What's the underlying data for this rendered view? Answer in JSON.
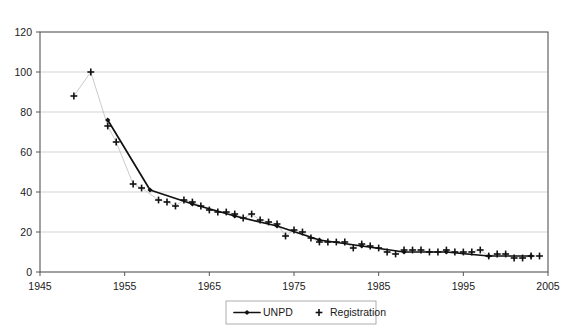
{
  "chart_data": {
    "type": "line",
    "title": "",
    "subtitle": "",
    "xlabel": "",
    "ylabel": "",
    "xlim": [
      1945,
      2005
    ],
    "ylim": [
      0,
      120
    ],
    "xticks": [
      1945,
      1955,
      1965,
      1975,
      1985,
      1995,
      2005
    ],
    "yticks": [
      0,
      20,
      40,
      60,
      80,
      100,
      120
    ],
    "grid": "horizontal",
    "legend_position": "bottom-center",
    "legend": [
      "UNPD",
      "Registration"
    ],
    "series": [
      {
        "name": "UNPD",
        "marker": "diamond",
        "line": true,
        "color": "#111111",
        "points": [
          {
            "x": 1953,
            "y": 76
          },
          {
            "x": 1958,
            "y": 41
          },
          {
            "x": 1963,
            "y": 34
          },
          {
            "x": 1968,
            "y": 28
          },
          {
            "x": 1973,
            "y": 23
          },
          {
            "x": 1978,
            "y": 16
          },
          {
            "x": 1983,
            "y": 13
          },
          {
            "x": 1988,
            "y": 10
          },
          {
            "x": 1993,
            "y": 10
          },
          {
            "x": 1998,
            "y": 8
          },
          {
            "x": 2003,
            "y": 8
          }
        ]
      },
      {
        "name": "Registration",
        "marker": "plus",
        "line": false,
        "color": "#111111",
        "points": [
          {
            "x": 1949,
            "y": 88
          },
          {
            "x": 1951,
            "y": 100
          },
          {
            "x": 1953,
            "y": 73
          },
          {
            "x": 1954,
            "y": 65
          },
          {
            "x": 1956,
            "y": 44
          },
          {
            "x": 1957,
            "y": 42
          },
          {
            "x": 1959,
            "y": 36
          },
          {
            "x": 1960,
            "y": 35
          },
          {
            "x": 1961,
            "y": 33
          },
          {
            "x": 1962,
            "y": 36
          },
          {
            "x": 1963,
            "y": 35
          },
          {
            "x": 1964,
            "y": 33
          },
          {
            "x": 1965,
            "y": 31
          },
          {
            "x": 1966,
            "y": 30
          },
          {
            "x": 1967,
            "y": 30
          },
          {
            "x": 1968,
            "y": 29
          },
          {
            "x": 1969,
            "y": 27
          },
          {
            "x": 1970,
            "y": 29
          },
          {
            "x": 1971,
            "y": 26
          },
          {
            "x": 1972,
            "y": 25
          },
          {
            "x": 1973,
            "y": 24
          },
          {
            "x": 1974,
            "y": 18
          },
          {
            "x": 1975,
            "y": 21
          },
          {
            "x": 1976,
            "y": 20
          },
          {
            "x": 1977,
            "y": 17
          },
          {
            "x": 1978,
            "y": 15
          },
          {
            "x": 1979,
            "y": 15
          },
          {
            "x": 1980,
            "y": 15
          },
          {
            "x": 1981,
            "y": 15
          },
          {
            "x": 1982,
            "y": 12
          },
          {
            "x": 1983,
            "y": 14
          },
          {
            "x": 1984,
            "y": 13
          },
          {
            "x": 1985,
            "y": 12
          },
          {
            "x": 1986,
            "y": 10
          },
          {
            "x": 1987,
            "y": 9
          },
          {
            "x": 1988,
            "y": 11
          },
          {
            "x": 1989,
            "y": 11
          },
          {
            "x": 1990,
            "y": 11
          },
          {
            "x": 1991,
            "y": 10
          },
          {
            "x": 1992,
            "y": 10
          },
          {
            "x": 1993,
            "y": 11
          },
          {
            "x": 1994,
            "y": 10
          },
          {
            "x": 1995,
            "y": 10
          },
          {
            "x": 1996,
            "y": 10
          },
          {
            "x": 1997,
            "y": 11
          },
          {
            "x": 1998,
            "y": 8
          },
          {
            "x": 1999,
            "y": 9
          },
          {
            "x": 2000,
            "y": 9
          },
          {
            "x": 2001,
            "y": 7
          },
          {
            "x": 2002,
            "y": 7
          },
          {
            "x": 2003,
            "y": 8
          },
          {
            "x": 2004,
            "y": 8
          }
        ]
      }
    ],
    "connector_points": [
      {
        "x": 1949,
        "y": 88
      },
      {
        "x": 1951,
        "y": 100
      },
      {
        "x": 1953,
        "y": 73
      },
      {
        "x": 1954,
        "y": 65
      },
      {
        "x": 1956,
        "y": 44
      },
      {
        "x": 1957,
        "y": 42
      },
      {
        "x": 1959,
        "y": 36
      },
      {
        "x": 1960,
        "y": 35
      },
      {
        "x": 1961,
        "y": 33
      },
      {
        "x": 1962,
        "y": 36
      },
      {
        "x": 1963,
        "y": 35
      },
      {
        "x": 1964,
        "y": 33
      },
      {
        "x": 1965,
        "y": 31
      },
      {
        "x": 1966,
        "y": 30
      },
      {
        "x": 1967,
        "y": 30
      },
      {
        "x": 1968,
        "y": 29
      },
      {
        "x": 1969,
        "y": 27
      },
      {
        "x": 1970,
        "y": 29
      },
      {
        "x": 1971,
        "y": 26
      },
      {
        "x": 1972,
        "y": 25
      },
      {
        "x": 1973,
        "y": 24
      },
      {
        "x": 1974,
        "y": 18
      },
      {
        "x": 1975,
        "y": 21
      },
      {
        "x": 1976,
        "y": 20
      },
      {
        "x": 1977,
        "y": 17
      },
      {
        "x": 1978,
        "y": 15
      },
      {
        "x": 1979,
        "y": 15
      },
      {
        "x": 1980,
        "y": 15
      },
      {
        "x": 1981,
        "y": 15
      },
      {
        "x": 1982,
        "y": 12
      },
      {
        "x": 1983,
        "y": 14
      },
      {
        "x": 1984,
        "y": 13
      },
      {
        "x": 1985,
        "y": 12
      },
      {
        "x": 1986,
        "y": 10
      },
      {
        "x": 1987,
        "y": 9
      },
      {
        "x": 1988,
        "y": 11
      },
      {
        "x": 1989,
        "y": 11
      },
      {
        "x": 1990,
        "y": 11
      },
      {
        "x": 1991,
        "y": 10
      },
      {
        "x": 1992,
        "y": 10
      },
      {
        "x": 1993,
        "y": 11
      },
      {
        "x": 1994,
        "y": 10
      },
      {
        "x": 1995,
        "y": 10
      },
      {
        "x": 1996,
        "y": 10
      },
      {
        "x": 1997,
        "y": 11
      },
      {
        "x": 1998,
        "y": 8
      },
      {
        "x": 1999,
        "y": 9
      },
      {
        "x": 2000,
        "y": 9
      },
      {
        "x": 2001,
        "y": 7
      },
      {
        "x": 2002,
        "y": 7
      },
      {
        "x": 2003,
        "y": 8
      },
      {
        "x": 2004,
        "y": 8
      }
    ],
    "colors": {
      "series_line": "#111111",
      "marker": "#111111",
      "gridline": "#c8c8c8",
      "border": "#555555",
      "connector": "#bdbdbd",
      "background": "#ffffff"
    }
  },
  "plot_geometry": {
    "left": 40,
    "right": 548,
    "top": 32,
    "bottom": 272
  },
  "legend_geometry": {
    "x": 226,
    "y": 301,
    "width": 150,
    "height": 23
  }
}
